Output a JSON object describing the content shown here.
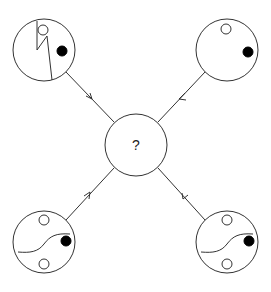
{
  "diagram": {
    "type": "puzzle-flow",
    "center": {
      "label": "?",
      "cx": 136,
      "cy": 145,
      "r": 31
    },
    "panels": [
      {
        "id": "top-left",
        "cx": 44,
        "cy": 50,
        "r": 31,
        "line": "zigzag",
        "open_dots": [
          {
            "dx": -4,
            "dy": -20
          }
        ],
        "filled_dots": [
          {
            "dx": 16,
            "dy": 2
          }
        ],
        "arrow_direction": "toward-center"
      },
      {
        "id": "top-right",
        "cx": 227,
        "cy": 50,
        "r": 31,
        "line": "none",
        "open_dots": [
          {
            "dx": -2,
            "dy": -20
          }
        ],
        "filled_dots": [
          {
            "dx": 20,
            "dy": 2
          }
        ],
        "arrow_direction": "toward-center"
      },
      {
        "id": "bottom-left",
        "cx": 44,
        "cy": 242,
        "r": 31,
        "line": "s-curve",
        "open_dots": [
          {
            "dx": -2,
            "dy": -20
          },
          {
            "dx": -2,
            "dy": 20
          }
        ],
        "filled_dots": [
          {
            "dx": 20,
            "dy": 0
          }
        ],
        "arrow_direction": "toward-center"
      },
      {
        "id": "bottom-right",
        "cx": 227,
        "cy": 242,
        "r": 31,
        "line": "s-curve",
        "open_dots": [
          {
            "dx": -2,
            "dy": -20
          },
          {
            "dx": -2,
            "dy": 20
          }
        ],
        "filled_dots": [
          {
            "dx": 20,
            "dy": 0
          }
        ],
        "arrow_direction": "toward-center"
      }
    ],
    "colors": {
      "stroke": "#333333",
      "fill": "#000000",
      "background": "#ffffff"
    }
  }
}
